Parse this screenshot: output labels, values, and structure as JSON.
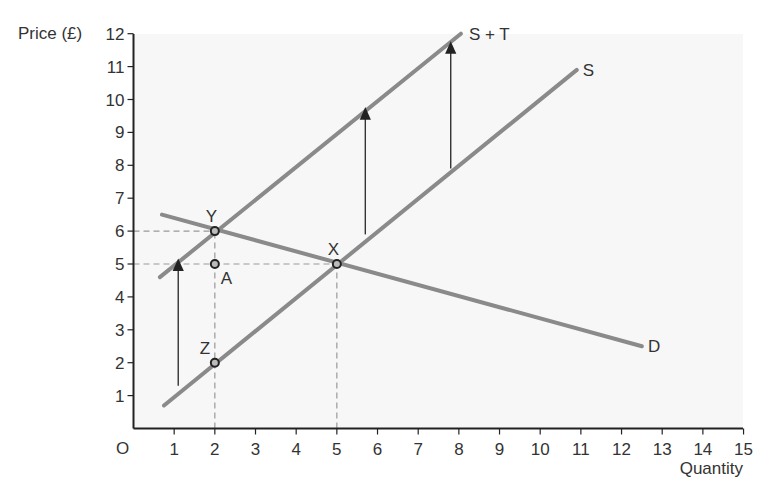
{
  "chart_data": {
    "type": "line",
    "title": "",
    "xlabel": "Quantity",
    "ylabel": "Price (£)",
    "origin_label": "O",
    "xlim": [
      0,
      15
    ],
    "ylim": [
      0,
      12
    ],
    "x_ticks": [
      "1",
      "2",
      "3",
      "4",
      "5",
      "6",
      "7",
      "8",
      "9",
      "10",
      "11",
      "12",
      "13",
      "14",
      "15"
    ],
    "y_ticks": [
      "1",
      "2",
      "3",
      "4",
      "5",
      "6",
      "7",
      "8",
      "9",
      "10",
      "11",
      "12"
    ],
    "grid": false,
    "series": [
      {
        "name": "D",
        "points": [
          [
            0.7,
            6.5
          ],
          [
            12.5,
            2.5
          ]
        ]
      },
      {
        "name": "S",
        "points": [
          [
            0.75,
            0.7
          ],
          [
            10.9,
            10.9
          ]
        ]
      },
      {
        "name": "S + T",
        "points": [
          [
            0.65,
            4.6
          ],
          [
            8.05,
            12
          ]
        ]
      }
    ],
    "points": [
      {
        "label": "Y",
        "x": 2,
        "y": 6
      },
      {
        "label": "A",
        "x": 2,
        "y": 5
      },
      {
        "label": "X",
        "x": 5,
        "y": 5
      },
      {
        "label": "Z",
        "x": 2,
        "y": 2
      }
    ],
    "arrows": [
      {
        "x": 1.1,
        "from": 1.3,
        "to": 5.0
      },
      {
        "x": 5.7,
        "from": 5.9,
        "to": 9.6
      },
      {
        "x": 7.8,
        "from": 7.9,
        "to": 11.6
      }
    ],
    "guides": [
      {
        "type": "h",
        "y": 6,
        "x_to": 2
      },
      {
        "type": "h",
        "y": 5,
        "x_to": 5
      },
      {
        "type": "v",
        "x": 2,
        "y_to": 6
      },
      {
        "type": "v",
        "x": 5,
        "y_to": 5
      }
    ],
    "colors": {
      "curves": "#8a8a8a",
      "axes": "#222222",
      "arrows": "#333333",
      "guides": "#999999"
    }
  }
}
